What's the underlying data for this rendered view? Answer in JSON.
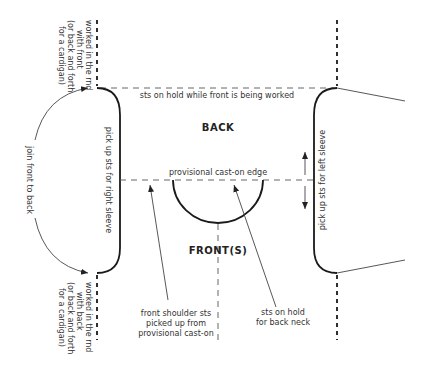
{
  "diagram": {
    "type": "knitting construction schematic",
    "pieces": {
      "back_label": "BACK",
      "front_label": "FRONT(S)"
    },
    "labels": {
      "top_edge": "sts on hold while front is being worked",
      "provisional_edge": "provisional cast-on edge",
      "right_sleeve": "pick up sts for right sleeve",
      "left_sleeve": "pick up sts for left sleeve",
      "join": "join front to back",
      "top_left_note": [
        "worked in the rnd",
        "with front",
        "(or back and forth",
        "for a cardigan)"
      ],
      "bottom_left_note": [
        "worked in the rnd",
        "with back",
        "(or back and forth",
        "for a cardigan)"
      ],
      "front_shoulder_note": [
        "front shoulder sts",
        "picked up from",
        "provisional cast-on"
      ],
      "back_neck_note": [
        "sts on hold",
        "for back neck"
      ]
    },
    "colors": {
      "line": "#1a1a1a",
      "text": "#333333",
      "background": "#ffffff"
    }
  }
}
